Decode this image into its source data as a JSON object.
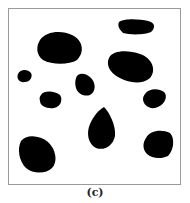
{
  "figure": {
    "caption": "(c)",
    "blob_color": "#000000",
    "background_color": "#ffffff",
    "frame_color": "#9a9a9a",
    "blob_count": 10
  }
}
